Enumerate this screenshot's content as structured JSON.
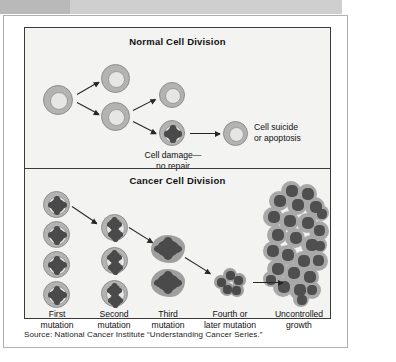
{
  "figure": {
    "panels": [
      {
        "id": "normal",
        "title": "Normal Cell Division",
        "labels": [
          {
            "id": "cell-damage",
            "text_line1": "Cell damage—",
            "text_line2": "no repair"
          },
          {
            "id": "apoptosis",
            "text_line1": "Cell suicide",
            "text_line2": "or apoptosis"
          }
        ],
        "cell_count_normal": 5,
        "damaged_cell_count": 1,
        "arrow_count": 5
      },
      {
        "id": "cancer",
        "title": "Cancer Cell Division",
        "stages": [
          {
            "label_line1": "First",
            "label_line2": "mutation",
            "cells": 4,
            "nuclei_per_cell": 1,
            "shape": "round"
          },
          {
            "label_line1": "Second",
            "label_line2": "mutation",
            "cells": 3,
            "nuclei_per_cell": 2,
            "shape": "round"
          },
          {
            "label_line1": "Third",
            "label_line2": "mutation",
            "cells": 2,
            "nuclei_per_cell": 1,
            "shape": "blob"
          },
          {
            "label_line1": "Fourth or",
            "label_line2": "later mutation",
            "cells": 1,
            "nuclei_per_cell": 1,
            "shape": "cluster"
          },
          {
            "label_line1": "Uncontrolled",
            "label_line2": "growth",
            "cells": 26,
            "nuclei_per_cell": 1,
            "shape": "mass"
          }
        ],
        "arrow_count": 4
      }
    ]
  },
  "source": {
    "text": "Source: National Cancer Institute “Understanding Cancer Series.”"
  },
  "colors": {
    "page_background": "#ffffff",
    "banner_dark": "#b9b9b9",
    "banner_light": "#cfcfcf",
    "panel_background": "#f3f3f1",
    "panel_border": "#3a3a3a",
    "card_border": "#b0b0b0",
    "cell_membrane": "#b3b3b3",
    "cell_cytoplasm": "#e6e6e4",
    "nucleus": "#4a4a4a",
    "tumor_cell": "#a8a8a8",
    "arrow": "#262626",
    "text": "#111111"
  }
}
